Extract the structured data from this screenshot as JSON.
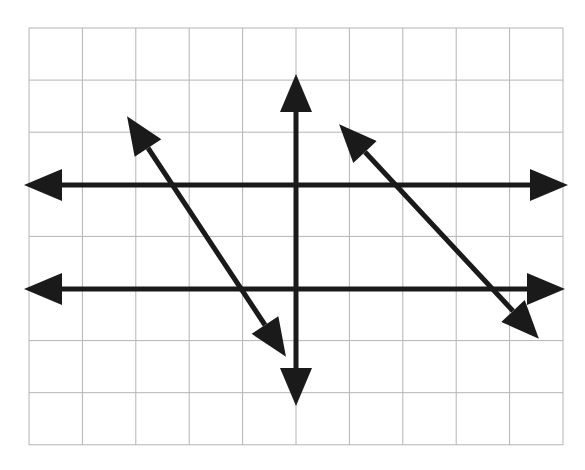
{
  "figure": {
    "canvas": {
      "width": 585,
      "height": 470,
      "background": "#ffffff"
    },
    "grid": {
      "label": "square grid",
      "origin_x": 29,
      "origin_y": 28,
      "right": 563,
      "bottom": 445,
      "columns": 10,
      "rows": 8,
      "cell_width": 53.4,
      "cell_height": 52.1,
      "line_color": "#b4b4b4",
      "line_width": 1,
      "show_grid": true
    },
    "lines": [
      {
        "name": "horizontal-line-upper",
        "type": "double-arrow",
        "orientation": "horizontal",
        "x1": 62,
        "y1": 185,
        "x2": 530,
        "y2": 185,
        "slope": 0,
        "color": "#1a1a1a",
        "stroke_width": 5
      },
      {
        "name": "horizontal-line-lower",
        "type": "double-arrow",
        "orientation": "horizontal",
        "x1": 62,
        "y1": 289,
        "x2": 527,
        "y2": 289,
        "slope": 0,
        "color": "#1a1a1a",
        "stroke_width": 5
      },
      {
        "name": "vertical-line",
        "type": "double-arrow",
        "orientation": "vertical",
        "x1": 296,
        "y1": 112,
        "x2": 296,
        "y2": 368,
        "slope": "undefined",
        "color": "#1a1a1a",
        "stroke_width": 5
      },
      {
        "name": "diagonal-line-left",
        "type": "double-arrow",
        "orientation": "diagonal",
        "x1": 148,
        "y1": 148,
        "x2": 265,
        "y2": 325,
        "slope": -1.51,
        "color": "#1a1a1a",
        "stroke_width": 5
      },
      {
        "name": "diagonal-line-right",
        "type": "double-arrow",
        "orientation": "diagonal",
        "x1": 365,
        "y1": 152,
        "x2": 513,
        "y2": 311,
        "slope": -1.07,
        "color": "#1a1a1a",
        "stroke_width": 5
      }
    ]
  },
  "chart_data": {
    "type": "line",
    "xlabel": "",
    "ylabel": "",
    "grid": true,
    "legend": "none",
    "xlim": [
      0,
      10
    ],
    "ylim": [
      0,
      8
    ],
    "series": [
      {
        "name": "horizontal-line-upper",
        "x": [
          0.62,
          9.39
        ],
        "y": [
          5.0,
          5.0
        ],
        "slope": 0,
        "arrows": "both"
      },
      {
        "name": "horizontal-line-lower",
        "x": [
          0.62,
          9.33
        ],
        "y": [
          3.0,
          3.0
        ],
        "slope": 0,
        "arrows": "both"
      },
      {
        "name": "vertical-line",
        "x": [
          5.0,
          5.0
        ],
        "y": [
          6.4,
          1.48
        ],
        "slope": null,
        "arrows": "both"
      },
      {
        "name": "diagonal-line-left",
        "x": [
          2.23,
          4.42
        ],
        "y": [
          5.71,
          2.3
        ],
        "slope": -1.51,
        "arrows": "both"
      },
      {
        "name": "diagonal-line-right",
        "x": [
          6.29,
          9.06
        ],
        "y": [
          5.63,
          2.57
        ],
        "slope": -1.07,
        "arrows": "both"
      }
    ]
  }
}
